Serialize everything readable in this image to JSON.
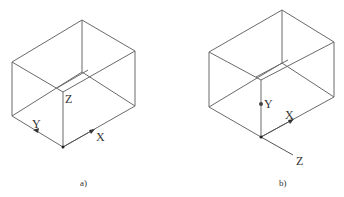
{
  "figures": [
    {
      "id": "a",
      "caption": "a)",
      "axis_labels": {
        "x": "X",
        "y": "Y",
        "z": "Z"
      },
      "description": "Isometric box with origin at front-bottom corner; Z label at front-top corner"
    },
    {
      "id": "b",
      "caption": "b)",
      "axis_labels": {
        "x": "X",
        "y": "Y",
        "z": "Z"
      },
      "description": "Isometric box with origin at front-bottom corner; Z axis extends outward toward viewer"
    }
  ]
}
